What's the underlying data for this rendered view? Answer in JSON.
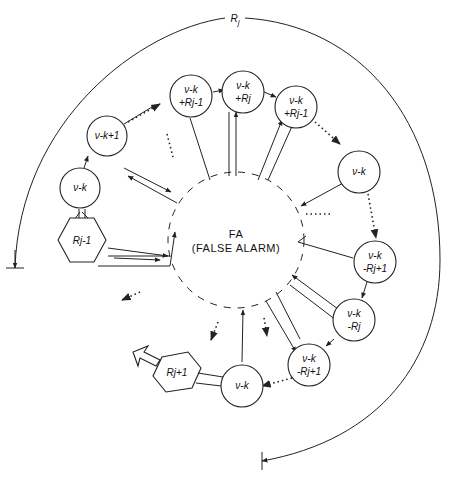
{
  "diagram": {
    "outer_arc_label": "R_j",
    "outer_arc_label_main": "R",
    "outer_arc_label_sub": "j",
    "center": {
      "line1": "FA",
      "line2": "(FALSE ALARM)"
    },
    "nodes": [
      {
        "id": "n1",
        "line1": "ν-k",
        "line2": ""
      },
      {
        "id": "n2",
        "line1": "ν-k+1",
        "line2": ""
      },
      {
        "id": "n3",
        "line1": "ν-k",
        "line2": "+Rj-1"
      },
      {
        "id": "n4",
        "line1": "ν-k",
        "line2": "+Rj"
      },
      {
        "id": "n5",
        "line1": "ν-k",
        "line2": "+Rj-1"
      },
      {
        "id": "n6",
        "line1": "ν-k",
        "line2": ""
      },
      {
        "id": "n7",
        "line1": "ν-k",
        "line2": "-Rj+1"
      },
      {
        "id": "n8",
        "line1": "ν-k",
        "line2": "-Rj"
      },
      {
        "id": "n9",
        "line1": "ν-k",
        "line2": "-Rj+1"
      },
      {
        "id": "n10",
        "line1": "ν-k",
        "line2": ""
      }
    ],
    "hexagons": [
      {
        "id": "h1",
        "label": "Rj-1"
      },
      {
        "id": "h2",
        "label": "Rj+1"
      }
    ],
    "ellipsis": "···"
  }
}
